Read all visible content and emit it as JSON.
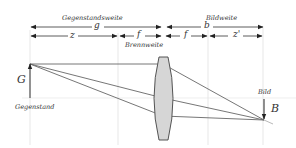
{
  "diagram": {
    "type": "thin-lens-imaging",
    "labels": {
      "object_distance_title": "Gegenstandsweite",
      "object_distance_symbol": "g",
      "image_distance_title": "Bildweite",
      "image_distance_symbol": "b",
      "z_symbol": "z",
      "f_left_symbol": "f",
      "f_right_symbol": "f",
      "z_prime_symbol": "z'",
      "focal_length_title": "Brennweite",
      "object_symbol": "G",
      "object_title": "Gegenstand",
      "image_title": "Bild",
      "image_symbol": "B"
    },
    "colors": {
      "line": "#555555",
      "guide": "#dddddd",
      "lens_fill": "#d6d6d6",
      "lens_stroke": "#444444",
      "axis": "#e4e4e4"
    }
  }
}
